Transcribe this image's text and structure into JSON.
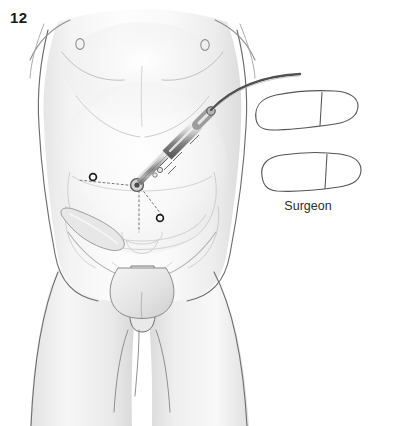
{
  "figure": {
    "number": "12",
    "kind": "medical-illustration",
    "background_color": "#ffffff"
  },
  "labels": {
    "surgeon": "Surgeon"
  },
  "colors": {
    "outline": "#4a4a4a",
    "soft_outline": "#8d8d8d",
    "skin_light": "#fbfbfb",
    "skin_shade": "#e3e3e3",
    "skin_shade_deep": "#cfcfcf",
    "internal_anatomy": "#d8d8d8",
    "port_marker": "#1c1c1c",
    "instrument_metal": "#b9b9b9",
    "instrument_dark": "#6e6e6e",
    "cable": "#555555",
    "shoe_outline": "#555555",
    "dotted_guide": "#777777",
    "label_text": "#2b2b2b",
    "figure_number": "#1a1a1a"
  },
  "annotations": {
    "port_markers": [
      {
        "name": "left-lower-quadrant-port",
        "cx": 93,
        "cy": 177,
        "r": 3.4
      },
      {
        "name": "right-lower-quadrant-port",
        "cx": 160,
        "cy": 218,
        "r": 3.4
      },
      {
        "name": "umbilical-port",
        "cx": 139,
        "cy": 184,
        "r": 5.0
      }
    ],
    "nipples": [
      {
        "name": "left-nipple",
        "cx": 80,
        "cy": 44
      },
      {
        "name": "right-nipple",
        "cx": 205,
        "cy": 45
      }
    ],
    "footprints": [
      {
        "name": "upper-shoe-outline",
        "toe_side": "right"
      },
      {
        "name": "lower-shoe-outline",
        "toe_side": "right"
      }
    ],
    "instrument": {
      "name": "laparoscope-trocar",
      "entry_point": "umbilicus",
      "cable": "light-cable-curving-upper-right"
    }
  }
}
